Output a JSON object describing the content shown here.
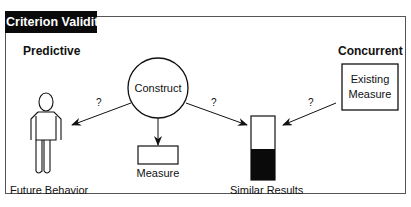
{
  "title": "Criterion Validity",
  "sections": {
    "predictive": "Predictive",
    "concurrent": "Concurrent"
  },
  "nodes": {
    "construct": "Construct",
    "measure": "Measure",
    "existing_measure_line1": "Existing",
    "existing_measure_line2": "Measure",
    "future_behavior": "Future Behavior",
    "similar_results": "Similar Results"
  },
  "arrows": {
    "construct_to_future": "?",
    "construct_to_results": "?",
    "existing_to_results": "?"
  }
}
